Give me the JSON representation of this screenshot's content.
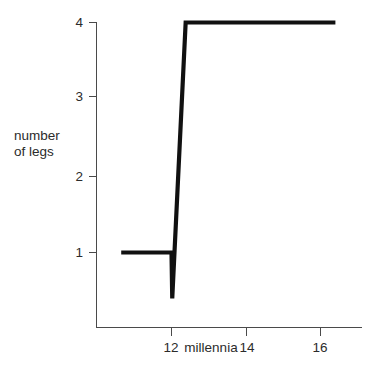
{
  "chart_data": {
    "type": "line",
    "title": "",
    "subtitle": "",
    "xlabel": "millennia",
    "ylabel": "number of legs",
    "ylabel_line1": "number",
    "ylabel_line2": "of legs",
    "xlim": [
      10.0,
      17.1
    ],
    "ylim": [
      0.0,
      4.3
    ],
    "grid": false,
    "legend": null,
    "x_ticks": [
      {
        "value": 12,
        "label": "12"
      },
      {
        "value": 14,
        "label": "14"
      },
      {
        "value": 16,
        "label": "16"
      }
    ],
    "y_ticks": [
      {
        "value": 1,
        "label": "1"
      },
      {
        "value": 2,
        "label": "2"
      },
      {
        "value": 3,
        "label": "3"
      },
      {
        "value": 4,
        "label": "4"
      }
    ],
    "series": [
      {
        "name": "number of legs",
        "color": "#111111",
        "x": [
          10.65,
          12.0,
          12.02,
          12.38,
          16.4
        ],
        "y": [
          1.0,
          1.0,
          0.4,
          4.0,
          4.0
        ],
        "points": [
          {
            "x": 10.65,
            "y": 1.0
          },
          {
            "x": 12.0,
            "y": 1.0
          },
          {
            "x": 12.02,
            "y": 0.4
          },
          {
            "x": 12.38,
            "y": 4.0
          },
          {
            "x": 16.4,
            "y": 4.0
          }
        ]
      }
    ],
    "annotations": [
      {
        "text": "millennia",
        "kind": "axis-title",
        "position": "x-axis-inline"
      }
    ]
  },
  "axis_labels": {
    "y_4": "4",
    "y_3": "3",
    "y_2": "2",
    "y_1": "1",
    "x_12": "12",
    "x_millennia": "millennia",
    "x_14": "14",
    "x_16": "16"
  },
  "colors": {
    "line": "#111111",
    "axis": "#4a4a4a",
    "text": "#2b2b2b",
    "background": "#ffffff"
  }
}
